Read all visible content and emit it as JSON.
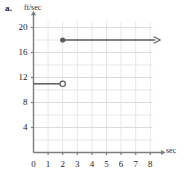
{
  "figure": {
    "part_label": "a.",
    "y_unit_label": "ft/sec",
    "x_unit_label": "sec"
  },
  "colors": {
    "grid_minor": "#e4e6ea",
    "grid_major": "#d8dbe0",
    "axis": "#7a7d82",
    "data": "#595b5f",
    "text": "#1a1a1a"
  },
  "chart_data": {
    "type": "line",
    "title": "",
    "subtitle": "",
    "xlabel": "sec",
    "ylabel": "ft/sec",
    "xlim": [
      0,
      8.6
    ],
    "ylim": [
      0,
      21.5
    ],
    "xticks": [
      0,
      1,
      2,
      3,
      4,
      5,
      6,
      7,
      8
    ],
    "xtick_labels": [
      "0",
      "1",
      "2",
      "3",
      "4",
      "5",
      "6",
      "7",
      "8"
    ],
    "yticks": [
      4,
      8,
      12,
      16,
      20
    ],
    "ytick_labels": [
      "4",
      "8",
      "12",
      "16",
      "20"
    ],
    "grid": true,
    "grid_x_step": 1,
    "grid_y_step": 2,
    "legend": "none",
    "axis_arrows": [
      "x-right",
      "y-up"
    ],
    "series": [
      {
        "name": "segment-low",
        "type": "segment",
        "x": [
          0,
          2
        ],
        "y": [
          11,
          11
        ],
        "start_marker": "none",
        "end_marker": "open-circle",
        "arrow": false
      },
      {
        "name": "ray-high",
        "type": "ray",
        "x": [
          2,
          8
        ],
        "y": [
          18,
          18
        ],
        "start_marker": "filled-circle",
        "end_marker": "arrow",
        "arrow": true
      }
    ],
    "annotations": [
      {
        "label": "a.",
        "x": 0,
        "y": 21.5,
        "style": "bold"
      }
    ]
  }
}
